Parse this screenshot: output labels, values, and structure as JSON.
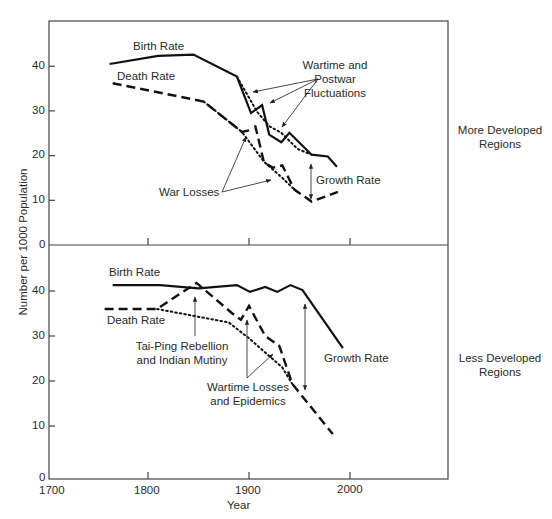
{
  "chart_data": {
    "type": "line",
    "title": "",
    "xlabel": "Year",
    "ylabel": "Number per 1000 Population",
    "xlim": [
      1700,
      2050
    ],
    "x_ticks": [
      1700,
      1800,
      1900,
      2000
    ],
    "grid": false,
    "panels": [
      {
        "name": "More Developed Regions",
        "ylim": [
          0,
          50
        ],
        "y_ticks": [
          0,
          10,
          20,
          30,
          40
        ],
        "series": [
          {
            "name": "Birth Rate",
            "style": "solid",
            "points": [
              [
                1762,
                40.5
              ],
              [
                1810,
                42.3
              ],
              [
                1845,
                42.6
              ],
              [
                1888,
                37.7
              ],
              [
                1902,
                29.5
              ],
              [
                1913,
                31.3
              ],
              [
                1920,
                24.7
              ],
              [
                1932,
                23.0
              ],
              [
                1940,
                25.1
              ],
              [
                1962,
                20.2
              ],
              [
                1978,
                19.8
              ],
              [
                1987,
                17.5
              ]
            ]
          },
          {
            "name": "Birth Rate (trend without wartime fluctuations)",
            "style": "dotted",
            "points": [
              [
                1888,
                37.7
              ],
              [
                1908,
                29.8
              ],
              [
                1920,
                26.6
              ],
              [
                1932,
                25.1
              ],
              [
                1948,
                21.5
              ],
              [
                1962,
                20.2
              ]
            ]
          },
          {
            "name": "Death Rate",
            "style": "dashed",
            "points": [
              [
                1765,
                36.2
              ],
              [
                1855,
                32.1
              ],
              [
                1893,
                25.3
              ],
              [
                1905,
                25.9
              ]
            ]
          },
          {
            "name": "Death Rate (war losses)",
            "style": "dashed",
            "points": [
              [
                1906,
                26.8
              ],
              [
                1915,
                18.4
              ],
              [
                1924,
                17.3
              ],
              [
                1933,
                17.8
              ],
              [
                1945,
                12.4
              ],
              [
                1962,
                9.7
              ],
              [
                1988,
                11.9
              ]
            ]
          },
          {
            "name": "Death Rate (trend without war losses)",
            "style": "dotted",
            "points": [
              [
                1855,
                32.1
              ],
              [
                1893,
                25.3
              ],
              [
                1915,
                18.6
              ],
              [
                1933,
                15.0
              ],
              [
                1945,
                12.4
              ]
            ]
          }
        ],
        "annotations": [
          {
            "text": "Birth Rate",
            "x": 1810,
            "y": 44.5
          },
          {
            "text": "Death Rate",
            "x": 1810,
            "y": 38.5
          },
          {
            "text": "Wartime and Postwar Fluctuations",
            "x": 1988,
            "y": 37
          },
          {
            "text": "War Losses",
            "x": 1845,
            "y": 11.5
          },
          {
            "text": "Growth Rate",
            "x": 1998,
            "y": 14.5
          }
        ]
      },
      {
        "name": "Less Developed Regions",
        "ylim": [
          0,
          40
        ],
        "y_ticks": [
          0,
          10,
          20,
          30,
          40
        ],
        "series": [
          {
            "name": "Birth Rate",
            "style": "solid",
            "points": [
              [
                1765,
                41.3
              ],
              [
                1812,
                41.3
              ],
              [
                1850,
                40.6
              ],
              [
                1888,
                41.3
              ],
              [
                1901,
                39.8
              ],
              [
                1916,
                40.9
              ],
              [
                1928,
                39.8
              ],
              [
                1941,
                41.3
              ],
              [
                1953,
                40.2
              ],
              [
                1993,
                27.3
              ]
            ]
          },
          {
            "name": "Death Rate",
            "style": "dashed",
            "points": [
              [
                1757,
                36.0
              ],
              [
                1809,
                36.0
              ],
              [
                1848,
                41.8
              ],
              [
                1883,
                35.1
              ],
              [
                1892,
                33.6
              ],
              [
                1900,
                36.7
              ],
              [
                1916,
                30.0
              ],
              [
                1930,
                27.8
              ],
              [
                1943,
                19.3
              ],
              [
                1983,
                8.2
              ]
            ]
          },
          {
            "name": "Death Rate (trend without losses)",
            "style": "dotted",
            "points": [
              [
                1809,
                36.0
              ],
              [
                1880,
                33.0
              ],
              [
                1900,
                29.5
              ],
              [
                1933,
                23.0
              ],
              [
                1943,
                19.3
              ]
            ]
          }
        ],
        "annotations": [
          {
            "text": "Birth Rate",
            "x": 1805,
            "y": 44
          },
          {
            "text": "Death Rate",
            "x": 1805,
            "y": 31.5
          },
          {
            "text": "Tai-Ping Rebellion and Indian Mutiny",
            "x": 1847,
            "y": 27
          },
          {
            "text": "Wartime Losses and Epidemics",
            "x": 1915,
            "y": 18
          },
          {
            "text": "Growth Rate",
            "x": 1997,
            "y": 28
          }
        ]
      }
    ]
  },
  "labels": {
    "y_axis": "Number per 1000 Population",
    "x_axis": "Year",
    "x_ticks": [
      "1700",
      "1800",
      "1900",
      "2000"
    ],
    "top_y_ticks": [
      "40",
      "30",
      "20",
      "10",
      "0"
    ],
    "bottom_y_ticks": [
      "40",
      "30",
      "20",
      "10",
      "0"
    ],
    "top": {
      "region_line1": "More Developed",
      "region_line2": "Regions",
      "birth_rate": "Birth Rate",
      "death_rate": "Death Rate",
      "wartime_line1": "Wartime and",
      "wartime_line2": "Postwar",
      "wartime_line3": "Fluctuations",
      "war_losses": "War Losses",
      "growth_rate": "Growth Rate"
    },
    "bottom": {
      "region_line1": "Less Developed",
      "region_line2": "Regions",
      "birth_rate": "Birth Rate",
      "death_rate": "Death Rate",
      "taiping_line1": "Tai-Ping Rebellion",
      "taiping_line2": "and Indian Mutiny",
      "wartime_line1": "Wartime Losses",
      "wartime_line2": "and Epidemics",
      "growth_rate": "Growth Rate"
    }
  },
  "colors": {
    "line": "#111111",
    "axis": "#444444",
    "text": "#2a2a2a",
    "background": "#ffffff"
  }
}
